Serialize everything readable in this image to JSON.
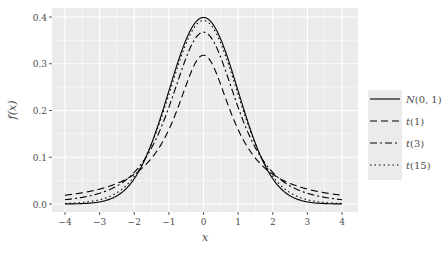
{
  "chart_data": {
    "type": "line",
    "title": "",
    "xlabel": "x",
    "ylabel": "f(x)",
    "xlim": [
      -4.25,
      4.25
    ],
    "ylim": [
      -0.02,
      0.42
    ],
    "x_ticks": [
      -4,
      -3,
      -2,
      -1,
      0,
      1,
      2,
      3,
      4
    ],
    "x_tick_labels": [
      "−4",
      "−3",
      "−2",
      "−1",
      "0",
      "1",
      "2",
      "3",
      "4"
    ],
    "y_ticks": [
      0.0,
      0.1,
      0.2,
      0.3,
      0.4
    ],
    "y_tick_labels": [
      "0.0",
      "0.1",
      "0.2",
      "0.3",
      "0.4"
    ],
    "grid": true,
    "legend_position": "right",
    "series": [
      {
        "name": "N(0, 1)",
        "label_main": "N",
        "label_args": "(0, 1)",
        "dist": "normal",
        "df": null,
        "dash": "",
        "peak": 0.399
      },
      {
        "name": "t(1)",
        "label_main": "t",
        "label_args": "(1)",
        "dist": "t",
        "df": 1,
        "dash": "7,4",
        "peak": 0.318
      },
      {
        "name": "t(3)",
        "label_main": "t",
        "label_args": "(3)",
        "dist": "t",
        "df": 3,
        "dash": "7,3,2,3",
        "peak": 0.368
      },
      {
        "name": "t(15)",
        "label_main": "t",
        "label_args": "(15)",
        "dist": "t",
        "df": 15,
        "dash": "1.5,3",
        "peak": 0.393
      }
    ]
  },
  "colors": {
    "panel_bg": "#ebebeb",
    "grid_major": "#ffffff",
    "line": "#000000",
    "text": "#4d4d4d"
  }
}
